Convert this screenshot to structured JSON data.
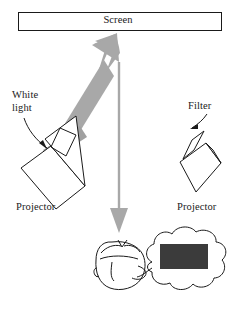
{
  "figure": {
    "background_color": "#ffffff",
    "line_color": "#1a1a1a",
    "arrow_gray": "#a8a8a8",
    "filter_gray": "#a0a0a0",
    "patch_dark": "#3b3b3b",
    "width": 236,
    "height": 309
  },
  "screen": {
    "label": "Screen",
    "box": {
      "x": 18,
      "y": 12,
      "width": 204,
      "height": 19
    }
  },
  "labels": {
    "white_light": "White\nlight",
    "filter": "Filter",
    "projector_left": "Projector",
    "projector_right": "Projector"
  },
  "elements": {
    "beam_arrow_up": {
      "name": "white-light-beam-arrow",
      "color": "#a8a8a8",
      "direction": "up-right",
      "from": {
        "x": 56,
        "y": 162
      },
      "to": {
        "x": 113,
        "y": 36
      }
    },
    "view_arrow_down": {
      "name": "viewer-sightline-arrow",
      "color": "#a8a8a8",
      "direction": "down",
      "from": {
        "x": 119,
        "y": 62
      },
      "to": {
        "x": 119,
        "y": 232
      }
    },
    "filter_bar": {
      "name": "filter-bar",
      "color": "#a0a0a0",
      "angle_deg": -35
    },
    "thought_patch": {
      "name": "perceived-color-patch",
      "color": "#3b3b3b",
      "x": 160,
      "y": 244,
      "width": 48,
      "height": 25
    }
  },
  "icons": {
    "screen": "screen-icon",
    "projector": "projector-icon",
    "filter": "filter-icon",
    "head": "observer-head-icon",
    "thought_bubble": "thought-bubble-icon",
    "arrow_up": "arrow-up-icon",
    "arrow_down": "arrow-down-icon",
    "leader_arrow": "leader-arrow-icon"
  }
}
